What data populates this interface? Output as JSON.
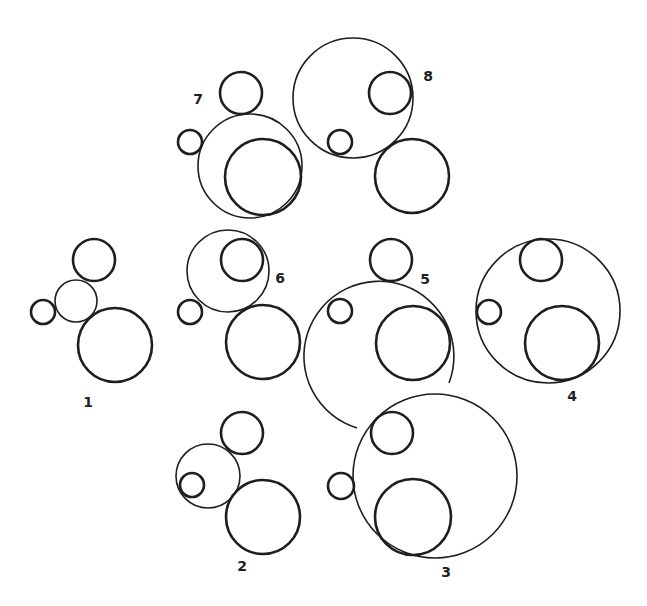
{
  "figure": {
    "stroke_color": "#1e1e1e",
    "background": "#ffffff"
  },
  "groups": [
    {
      "id": "1",
      "label": "1"
    },
    {
      "id": "2",
      "label": "2"
    },
    {
      "id": "3",
      "label": "3"
    },
    {
      "id": "4",
      "label": "4"
    },
    {
      "id": "5",
      "label": "5"
    },
    {
      "id": "6",
      "label": "6"
    },
    {
      "id": "7",
      "label": "7"
    },
    {
      "id": "8",
      "label": "8"
    }
  ]
}
